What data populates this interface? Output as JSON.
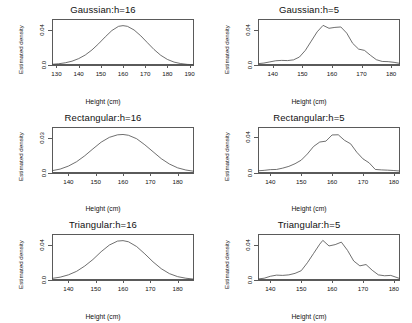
{
  "figure": {
    "background": "#ffffff",
    "axis_color": "#5a5a5a",
    "curve_color": "#4a4a4a",
    "layout": "2 columns x 3 rows of kernel density estimate panels",
    "shared_xlabel": "Height (cm)",
    "shared_ylabel": "Estimated density"
  },
  "chart_data": [
    {
      "type": "line",
      "title": "Gaussian:h=16",
      "xlabel": "Height (cm)",
      "ylabel": "Estimated density",
      "xlim": [
        128,
        192
      ],
      "ylim": [
        0,
        0.052
      ],
      "xticks": [
        130,
        140,
        150,
        160,
        170,
        180,
        190
      ],
      "yticks": [
        0.0,
        0.04
      ],
      "ytick_labels": [
        "0.0",
        "0.04"
      ],
      "grid": false,
      "legend": "none",
      "x": [
        128,
        131,
        134,
        137,
        140,
        143,
        146,
        149,
        152,
        155,
        158,
        160,
        162,
        165,
        168,
        171,
        174,
        177,
        180,
        183,
        186,
        189,
        192
      ],
      "y": [
        0.0008,
        0.0014,
        0.0025,
        0.0043,
        0.0072,
        0.0113,
        0.017,
        0.024,
        0.0318,
        0.039,
        0.0437,
        0.0445,
        0.0437,
        0.0396,
        0.033,
        0.0252,
        0.0175,
        0.011,
        0.0063,
        0.0033,
        0.0016,
        0.0007,
        0.0003
      ]
    },
    {
      "type": "line",
      "title": "Gaussian:h=5",
      "xlabel": "Height (cm)",
      "ylabel": "Estimated density",
      "xlim": [
        135,
        183
      ],
      "ylim": [
        0,
        0.052
      ],
      "xticks": [
        140,
        150,
        160,
        170,
        180
      ],
      "yticks": [
        0.0,
        0.04
      ],
      "ytick_labels": [
        "0.0",
        "0.04"
      ],
      "grid": false,
      "legend": "none",
      "x": [
        135,
        137,
        139,
        141,
        143,
        145,
        147,
        149,
        151,
        153,
        155,
        157,
        159,
        161,
        163,
        165,
        167,
        169,
        171,
        173,
        175,
        177,
        179,
        181,
        183
      ],
      "y": [
        0.0015,
        0.0022,
        0.0035,
        0.0048,
        0.0052,
        0.005,
        0.0058,
        0.009,
        0.0165,
        0.027,
        0.0375,
        0.0448,
        0.0415,
        0.0425,
        0.043,
        0.036,
        0.0245,
        0.018,
        0.0165,
        0.011,
        0.006,
        0.004,
        0.0038,
        0.003,
        0.0018
      ]
    },
    {
      "type": "line",
      "title": "Rectangular:h=16",
      "xlabel": "Height (cm)",
      "ylabel": "Estimated density",
      "xlim": [
        134,
        186
      ],
      "ylim": [
        0,
        0.04
      ],
      "xticks": [
        140,
        150,
        160,
        170,
        180
      ],
      "yticks": [
        0.0,
        0.03
      ],
      "ytick_labels": [
        "0.0",
        "0.03"
      ],
      "grid": false,
      "legend": "none",
      "x": [
        134,
        137,
        140,
        143,
        146,
        149,
        152,
        155,
        158,
        160,
        162,
        165,
        168,
        171,
        174,
        177,
        180,
        183,
        186
      ],
      "y": [
        0.002,
        0.0034,
        0.006,
        0.0098,
        0.015,
        0.021,
        0.0268,
        0.031,
        0.0332,
        0.0335,
        0.0328,
        0.0298,
        0.0245,
        0.0185,
        0.0125,
        0.0078,
        0.0045,
        0.0026,
        0.0015
      ]
    },
    {
      "type": "line",
      "title": "Rectangular:h=5",
      "xlabel": "Height (cm)",
      "ylabel": "Estimated density",
      "xlim": [
        136,
        182
      ],
      "ylim": [
        0,
        0.052
      ],
      "xticks": [
        140,
        150,
        160,
        170,
        180
      ],
      "yticks": [
        0.0,
        0.04
      ],
      "ytick_labels": [
        "0.0",
        "0.04"
      ],
      "grid": false,
      "legend": "none",
      "x": [
        136,
        138,
        140,
        142,
        144,
        146,
        148,
        150,
        152,
        154,
        156,
        158,
        160,
        162,
        164,
        166,
        168,
        170,
        172,
        174,
        176,
        178,
        180,
        182
      ],
      "y": [
        0.0025,
        0.003,
        0.0038,
        0.004,
        0.0055,
        0.0075,
        0.0105,
        0.0145,
        0.0215,
        0.03,
        0.035,
        0.036,
        0.043,
        0.0432,
        0.037,
        0.033,
        0.0235,
        0.016,
        0.0115,
        0.004,
        0.0035,
        0.0032,
        0.0028,
        0.0022
      ]
    },
    {
      "type": "line",
      "title": "Triangular:h=16",
      "xlabel": "Height (cm)",
      "ylabel": "Estimated density",
      "xlim": [
        134,
        186
      ],
      "ylim": [
        0,
        0.052
      ],
      "xticks": [
        140,
        150,
        160,
        170,
        180
      ],
      "yticks": [
        0.0,
        0.04
      ],
      "ytick_labels": [
        "0.0",
        "0.04"
      ],
      "grid": false,
      "legend": "none",
      "x": [
        134,
        137,
        140,
        143,
        146,
        149,
        152,
        155,
        158,
        160,
        162,
        165,
        168,
        171,
        174,
        177,
        180,
        183,
        186
      ],
      "y": [
        0.0018,
        0.0032,
        0.0058,
        0.0098,
        0.0158,
        0.0232,
        0.032,
        0.0395,
        0.044,
        0.0445,
        0.0432,
        0.0378,
        0.0295,
        0.0205,
        0.0128,
        0.0072,
        0.0038,
        0.002,
        0.001
      ]
    },
    {
      "type": "line",
      "title": "Triangular:h=5",
      "xlabel": "Height (cm)",
      "ylabel": "Estimated density",
      "xlim": [
        136,
        182
      ],
      "ylim": [
        0,
        0.052
      ],
      "xticks": [
        140,
        150,
        160,
        170,
        180
      ],
      "yticks": [
        0.0,
        0.04
      ],
      "ytick_labels": [
        "0.0",
        "0.04"
      ],
      "grid": false,
      "legend": "none",
      "x": [
        136,
        138,
        140,
        142,
        144,
        146,
        148,
        150,
        152,
        154,
        156,
        157,
        159,
        161,
        163,
        165,
        167,
        169,
        171,
        173,
        175,
        177,
        179,
        181,
        182
      ],
      "y": [
        0.0012,
        0.002,
        0.0042,
        0.0055,
        0.0052,
        0.0058,
        0.0075,
        0.0105,
        0.0195,
        0.03,
        0.0405,
        0.0448,
        0.0385,
        0.04,
        0.0428,
        0.0335,
        0.0215,
        0.016,
        0.0175,
        0.011,
        0.0058,
        0.0048,
        0.0052,
        0.0028,
        0.0015
      ]
    }
  ]
}
